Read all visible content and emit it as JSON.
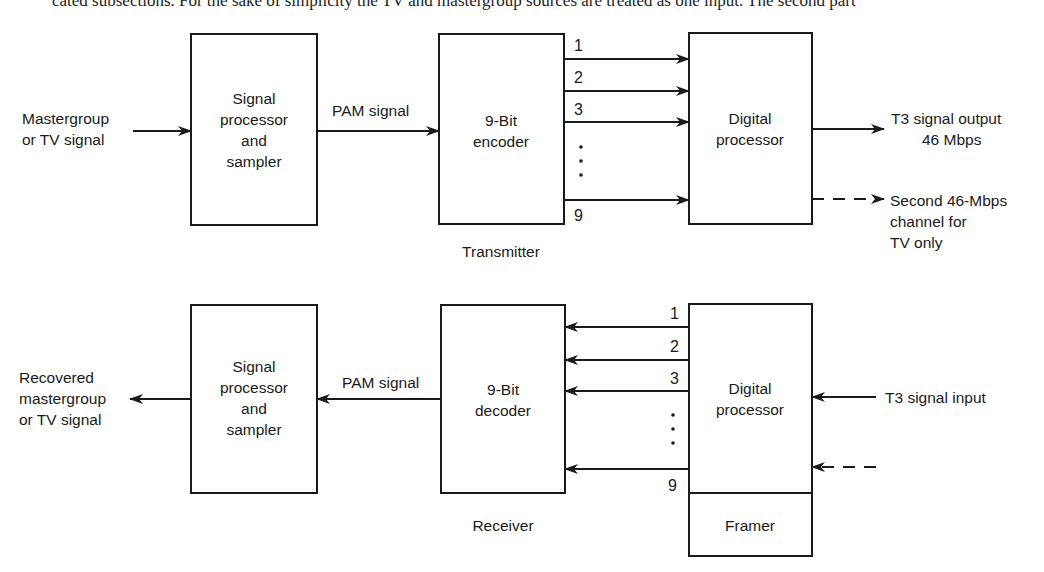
{
  "header_fragment": "cated subsections. For the sake of simplicity the TV and mastergroup sources are treated as one input. The second part",
  "transmitter": {
    "section_label": "Transmitter",
    "input_label": [
      "Mastergroup",
      "or TV signal"
    ],
    "sampler_box": [
      "Signal",
      "processor",
      "and",
      "sampler"
    ],
    "pam_label": "PAM signal",
    "encoder_box": [
      "9-Bit",
      "encoder"
    ],
    "bit_lines": [
      "1",
      "2",
      "3",
      "9"
    ],
    "digital_box": [
      "Digital",
      "processor"
    ],
    "output_label": [
      "T3 signal output",
      "46 Mbps"
    ],
    "second_channel_label": [
      "Second 46-Mbps",
      "channel for",
      "TV only"
    ]
  },
  "receiver": {
    "section_label": "Receiver",
    "output_label": [
      "Recovered",
      "mastergroup",
      "or TV signal"
    ],
    "sampler_box": [
      "Signal",
      "processor",
      "and",
      "sampler"
    ],
    "pam_label": "PAM signal",
    "decoder_box": [
      "9-Bit",
      "decoder"
    ],
    "bit_lines": [
      "1",
      "2",
      "3",
      "9"
    ],
    "digital_box": [
      "Digital",
      "processor"
    ],
    "framer_box": "Framer",
    "input_label": "T3 signal input"
  }
}
